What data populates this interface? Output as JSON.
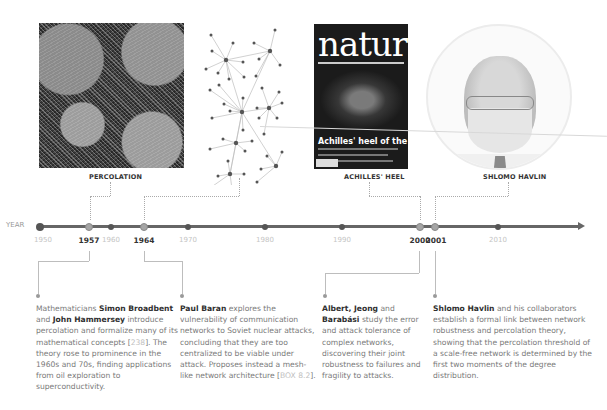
{
  "images": {
    "percolation": {
      "label": "PERCOLATION"
    },
    "network": {
      "label": ""
    },
    "nature_cover": {
      "label": "ACHILLES' HEEL",
      "masthead": "nature",
      "headline": "Achilles' heel of the internet"
    },
    "portrait": {
      "label": "SHLOMO HAVLIN"
    }
  },
  "timeline": {
    "axis_label": "YEAR",
    "color": "#666666",
    "years": [
      {
        "year": "1950",
        "x": 43,
        "highlight": false
      },
      {
        "year": "1957",
        "x": 89,
        "highlight": true
      },
      {
        "year": "1960",
        "x": 111,
        "highlight": false
      },
      {
        "year": "1964",
        "x": 144,
        "highlight": true
      },
      {
        "year": "1970",
        "x": 188,
        "highlight": false
      },
      {
        "year": "1980",
        "x": 265,
        "highlight": false
      },
      {
        "year": "1990",
        "x": 342,
        "highlight": false
      },
      {
        "year": "2000",
        "x": 420,
        "highlight": true
      },
      {
        "year": "2001",
        "x": 435,
        "highlight": true
      },
      {
        "year": "2010",
        "x": 498,
        "highlight": false
      }
    ]
  },
  "events": [
    {
      "year": "1957",
      "parts": [
        {
          "t": "Mathematicians ",
          "b": false
        },
        {
          "t": "Simon Broadbent",
          "b": true
        },
        {
          "t": " and ",
          "b": false
        },
        {
          "t": "John Hammersey",
          "b": true
        },
        {
          "t": " introduce percolation and formalize many of its mathematical concepts [",
          "b": false
        },
        {
          "t": "238",
          "ref": true
        },
        {
          "t": "]. The theory rose to prominence in the 1960s and 70s, finding applications from oil exploration to superconductivity.",
          "b": false
        }
      ]
    },
    {
      "year": "1964",
      "parts": [
        {
          "t": "Paul Baran",
          "b": true
        },
        {
          "t": " explores the vulnerability of communication networks to Soviet nuclear attacks, concluding that they are too centralized to be viable under attack. Proposes instead a mesh-like network architecture [",
          "b": false
        },
        {
          "t": "BOX 8.2",
          "ref": true
        },
        {
          "t": "].",
          "b": false
        }
      ]
    },
    {
      "year": "2000",
      "parts": [
        {
          "t": "Albert, Jeong",
          "b": true
        },
        {
          "t": " and ",
          "b": false
        },
        {
          "t": "Barabási",
          "b": true
        },
        {
          "t": " study the error and attack tolerance of complex networks, discovering their joint robustness to failures and fragility to attacks.",
          "b": false
        }
      ]
    },
    {
      "year": "2001",
      "parts": [
        {
          "t": "Shlomo Havlin",
          "b": true
        },
        {
          "t": " and his collaborators establish a formal link between network robustness and percolation theory, showing that the percolation threshold of a scale-free network is determined by the first two moments of the degree distribution.",
          "b": false
        }
      ]
    }
  ]
}
